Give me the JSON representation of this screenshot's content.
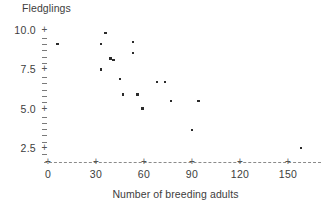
{
  "chart_data": {
    "type": "scatter",
    "title": "",
    "ylabel": "Fledglings",
    "xlabel": "Number of breeding adults",
    "xlim": [
      0,
      173
    ],
    "ylim": [
      1.9,
      10.4
    ],
    "grid": false,
    "legend": null,
    "x_ticks": [
      0,
      30,
      60,
      90,
      120,
      150
    ],
    "x_tick_labels": [
      "0",
      "30",
      "60",
      "90",
      "120",
      "150"
    ],
    "y_ticks": [
      2.5,
      5.0,
      7.5,
      10.0
    ],
    "y_tick_labels": [
      "2.5",
      "5.0",
      "7.5",
      "10.0"
    ],
    "y_minor_ticks": [
      2.1,
      2.9,
      3.3,
      3.7,
      4.1,
      4.5,
      5.4,
      5.8,
      6.2,
      6.6,
      7.0,
      7.9,
      8.3,
      8.7,
      9.1,
      9.5
    ],
    "point_color": "#2b2b2b",
    "axis_color": "#8b8b8b",
    "series": [
      {
        "name": "nests",
        "points": [
          {
            "x": 6,
            "y": 9.1
          },
          {
            "x": 33,
            "y": 9.1
          },
          {
            "x": 33,
            "y": 7.5
          },
          {
            "x": 36,
            "y": 9.8
          },
          {
            "x": 39,
            "y": 8.2
          },
          {
            "x": 41,
            "y": 8.1
          },
          {
            "x": 45,
            "y": 6.9
          },
          {
            "x": 47,
            "y": 5.9
          },
          {
            "x": 53,
            "y": 9.25
          },
          {
            "x": 53,
            "y": 8.55
          },
          {
            "x": 56,
            "y": 5.9
          },
          {
            "x": 59,
            "y": 5.0
          },
          {
            "x": 68,
            "y": 6.7
          },
          {
            "x": 73,
            "y": 6.7
          },
          {
            "x": 77,
            "y": 5.5
          },
          {
            "x": 90,
            "y": 3.65
          },
          {
            "x": 94,
            "y": 5.5
          },
          {
            "x": 158,
            "y": 2.5
          }
        ]
      }
    ]
  },
  "axes": {
    "y_title": "Fledglings",
    "x_title": "Number of breeding adults",
    "tick_glyph": "+"
  }
}
